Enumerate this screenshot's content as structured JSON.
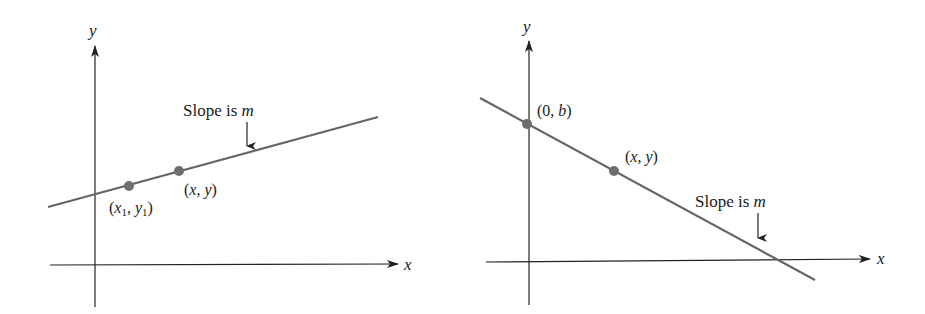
{
  "figure": {
    "colors": {
      "axis": "#222222",
      "line": "#666666",
      "point": "#6e6e6e",
      "text": "#1a1a1a",
      "background": "#ffffff"
    },
    "panels": [
      {
        "id": "left",
        "x_axis_label": "x",
        "y_axis_label": "y",
        "slope_label": "Slope is ",
        "slope_var": "m",
        "points": [
          {
            "label_open": "(",
            "var1": "x",
            "sub1": "1",
            "sep": ", ",
            "var2": "y",
            "sub2": "1",
            "label_close": ")"
          },
          {
            "label_open": "(",
            "var1": "x",
            "sep": ", ",
            "var2": "y",
            "label_close": ")"
          }
        ]
      },
      {
        "id": "right",
        "x_axis_label": "x",
        "y_axis_label": "y",
        "slope_label": "Slope is ",
        "slope_var": "m",
        "points": [
          {
            "label_open": "(",
            "num": "0",
            "sep": ", ",
            "var2": "b",
            "label_close": ")"
          },
          {
            "label_open": "(",
            "var1": "x",
            "sep": ", ",
            "var2": "y",
            "label_close": ")"
          }
        ]
      }
    ]
  }
}
